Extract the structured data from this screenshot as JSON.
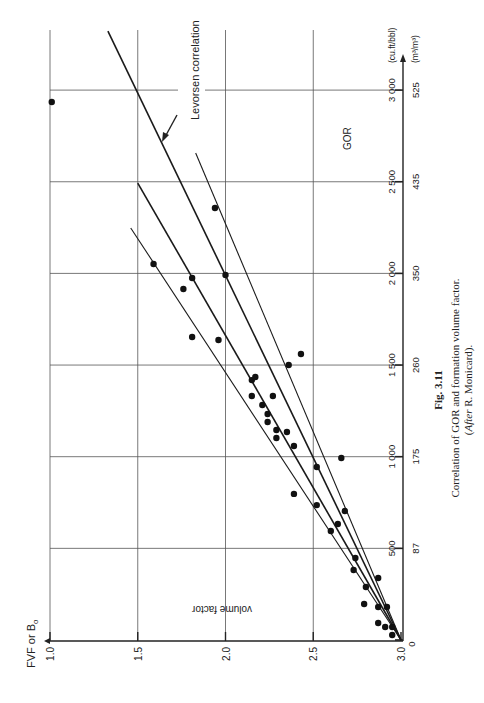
{
  "figure": {
    "label": "Fig. 3.11",
    "caption_line1": "Correlation of GOR and formation volume factor.",
    "caption_line2_italic": "After",
    "caption_line2_rest": " R. Monicard).",
    "caption_line2_open": "("
  },
  "axes": {
    "fvf_axis_title": "FVF or B",
    "fvf_axis_subscript": "o",
    "fvf_axis_inner_label": "volume factor",
    "gor_axis_inner_label": "GOR",
    "gor_unit_primary": "(cu.ft/bbl)",
    "gor_unit_secondary": "(m³/m³)",
    "fvf_ticks": [
      "3.0",
      "2.5",
      "2.0",
      "1.5",
      "1.0"
    ],
    "gor_ticks_primary": [
      "0",
      "500",
      "1 000",
      "1 500",
      "2 000",
      "2 500",
      "3 000"
    ],
    "gor_ticks_secondary": [
      "",
      "87",
      "175",
      "260",
      "350",
      "435",
      "525"
    ]
  },
  "annotation": {
    "levorsen_label": "Levorsen correlation"
  },
  "chart_data": {
    "type": "scatter",
    "title": "Correlation of GOR and formation volume factor",
    "orientation": "rotated 90° counter-clockwise on page",
    "xlabel": "GOR (cu.ft/bbl) / (m³/m³)",
    "ylabel": "FVF or Bo (volume factor)",
    "xlim": [
      0,
      3000
    ],
    "ylim": [
      1.0,
      3.0
    ],
    "grid": true,
    "x_ticks": [
      0,
      500,
      1000,
      1500,
      2000,
      2500,
      3000
    ],
    "x_ticks_secondary": [
      0,
      87,
      175,
      260,
      350,
      435,
      525
    ],
    "y_ticks": [
      1.0,
      1.5,
      2.0,
      2.5,
      3.0
    ],
    "series": [
      {
        "name": "Measured data",
        "kind": "points",
        "points": [
          [
            2935,
            2.99
          ],
          [
            2357,
            2.06
          ],
          [
            2051,
            2.41
          ],
          [
            1975,
            2.19
          ],
          [
            1915,
            2.24
          ],
          [
            1991,
            2.0
          ],
          [
            1653,
            2.19
          ],
          [
            1637,
            2.04
          ],
          [
            1560,
            1.57
          ],
          [
            1500,
            1.64
          ],
          [
            1418,
            1.85
          ],
          [
            1435,
            1.83
          ],
          [
            1331,
            1.85
          ],
          [
            1331,
            1.73
          ],
          [
            1282,
            1.79
          ],
          [
            1233,
            1.76
          ],
          [
            1189,
            1.76
          ],
          [
            1146,
            1.71
          ],
          [
            1135,
            1.65
          ],
          [
            1102,
            1.71
          ],
          [
            1058,
            1.61
          ],
          [
            993,
            1.34
          ],
          [
            944,
            1.48
          ],
          [
            797,
            1.61
          ],
          [
            736,
            1.48
          ],
          [
            704,
            1.32
          ],
          [
            633,
            1.36
          ],
          [
            595,
            1.4
          ],
          [
            447,
            1.26
          ],
          [
            382,
            1.27
          ],
          [
            338,
            1.13
          ],
          [
            289,
            1.2
          ],
          [
            196,
            1.21
          ],
          [
            180,
            1.13
          ],
          [
            180,
            1.08
          ],
          [
            93,
            1.13
          ],
          [
            71,
            1.09
          ],
          [
            71,
            1.05
          ],
          [
            27,
            1.05
          ]
        ]
      },
      {
        "name": "Levorsen correlation",
        "kind": "line",
        "points": [
          [
            0,
            1.0
          ],
          [
            3322,
            2.67
          ]
        ],
        "bold": true
      },
      {
        "name": "Correlation line A",
        "kind": "line",
        "points": [
          [
            0,
            1.0
          ],
          [
            2657,
            2.17
          ]
        ]
      },
      {
        "name": "Correlation line B",
        "kind": "line",
        "points": [
          [
            0,
            1.0
          ],
          [
            2493,
            2.5
          ]
        ],
        "bold": true
      },
      {
        "name": "Correlation line C",
        "kind": "line",
        "points": [
          [
            0,
            1.0
          ],
          [
            2248,
            2.54
          ]
        ]
      }
    ]
  }
}
